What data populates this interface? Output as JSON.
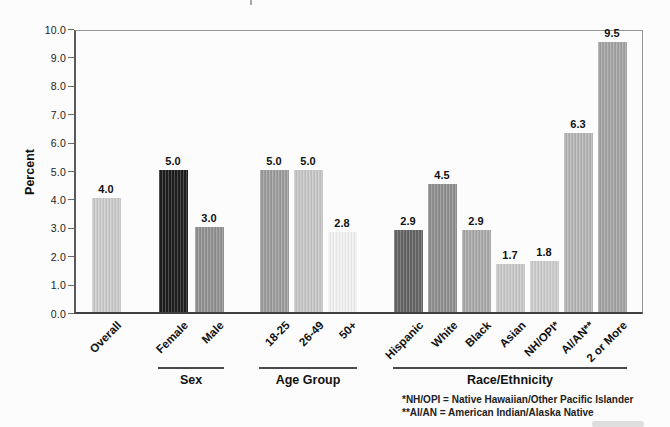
{
  "chart_data": {
    "type": "bar",
    "title": "",
    "ylabel": "Percent",
    "ylim": [
      0,
      10
    ],
    "ytick_step": 1.0,
    "ytick_labels": [
      "0.0",
      "1.0",
      "2.0",
      "3.0",
      "4.0",
      "5.0",
      "6.0",
      "7.0",
      "8.0",
      "9.0",
      "10.0"
    ],
    "grid": false,
    "legend": null,
    "groups": [
      {
        "label": "",
        "bars": [
          {
            "category": "Overall",
            "value": 4.0,
            "value_label": "4.0",
            "color": "#c9c9c9"
          }
        ]
      },
      {
        "label": "Sex",
        "bars": [
          {
            "category": "Female",
            "value": 5.0,
            "value_label": "5.0",
            "color": "#1d1d1d"
          },
          {
            "category": "Male",
            "value": 3.0,
            "value_label": "3.0",
            "color": "#909090"
          }
        ]
      },
      {
        "label": "Age Group",
        "bars": [
          {
            "category": "18-25",
            "value": 5.0,
            "value_label": "5.0",
            "color": "#9b9b9b"
          },
          {
            "category": "26-49",
            "value": 5.0,
            "value_label": "5.0",
            "color": "#c5c5c5"
          },
          {
            "category": "50+",
            "value": 2.8,
            "value_label": "2.8",
            "color": "#f0f0f0"
          }
        ]
      },
      {
        "label": "Race/Ethnicity",
        "bars": [
          {
            "category": "Hispanic",
            "value": 2.9,
            "value_label": "2.9",
            "color": "#636363"
          },
          {
            "category": "White",
            "value": 4.5,
            "value_label": "4.5",
            "color": "#8d8d8d"
          },
          {
            "category": "Black",
            "value": 2.9,
            "value_label": "2.9",
            "color": "#a8a8a8"
          },
          {
            "category": "Asian",
            "value": 1.7,
            "value_label": "1.7",
            "color": "#c7c7c7"
          },
          {
            "category": "NH/OPI*",
            "value": 1.8,
            "value_label": "1.8",
            "color": "#cbcbcb"
          },
          {
            "category": "AI/AN**",
            "value": 6.3,
            "value_label": "6.3",
            "color": "#b4b4b4"
          },
          {
            "category": "2 or More",
            "value": 9.5,
            "value_label": "9.5",
            "color": "#a2a2a2"
          }
        ]
      }
    ],
    "footnotes": [
      "*NH/OPI = Native Hawaiian/Other Pacific Islander",
      "**AI/AN = American Indian/Alaska Native"
    ]
  }
}
